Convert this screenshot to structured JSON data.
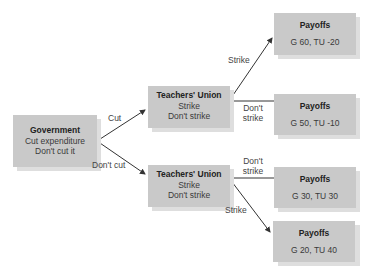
{
  "government": {
    "title": "Government",
    "options": [
      "Cut expenditure",
      "Don't cut it"
    ]
  },
  "teachers_union_top": {
    "title": "Teachers' Union",
    "options": [
      "Strike",
      "Don't strike"
    ]
  },
  "teachers_union_bottom": {
    "title": "Teachers' Union",
    "options": [
      "Strike",
      "Don't strike"
    ]
  },
  "edges": {
    "cut": "Cut",
    "dont_cut": "Don't cut",
    "top_strike": "Strike",
    "top_dont_strike_1": "Don't",
    "top_dont_strike_2": "strike",
    "bottom_dont_strike_1": "Don't",
    "bottom_dont_strike_2": "strike",
    "bottom_strike": "Strike"
  },
  "payoffs": [
    {
      "title": "Payoffs",
      "value": "G 60, TU -20"
    },
    {
      "title": "Payoffs",
      "value": "G 50, TU -10"
    },
    {
      "title": "Payoffs",
      "value": "G 30, TU 30"
    },
    {
      "title": "Payoffs",
      "value": "G 20, TU 40"
    }
  ],
  "colors": {
    "box": "#c9c9c9",
    "shadow": "#dedede",
    "line": "#333333"
  }
}
